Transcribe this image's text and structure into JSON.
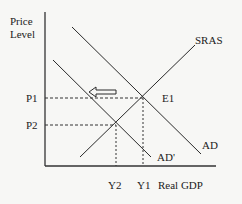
{
  "diagram": {
    "type": "AD-AS model",
    "y_axis_label_line1": "Price",
    "y_axis_label_line2": "Level",
    "x_axis_label": "Real GDP",
    "curves": {
      "sras": "SRAS",
      "ad": "AD",
      "ad_shifted": "AD'"
    },
    "equilibrium_label": "E1",
    "price_levels": {
      "p1": "P1",
      "p2": "P2"
    },
    "outputs": {
      "y1": "Y1",
      "y2": "Y2"
    },
    "shift_direction": "left",
    "colors": {
      "line": "#2a2a2a",
      "background": "#f7f7f5"
    }
  }
}
